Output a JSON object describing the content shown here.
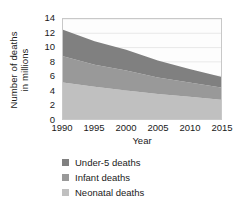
{
  "chart_data": {
    "type": "area",
    "title": "",
    "xlabel": "Year",
    "ylabel": "Number of deaths in millions",
    "ylabel_line1": "Number of deaths",
    "ylabel_line2": "in millions",
    "stacked": true,
    "grid": true,
    "legend_position": "bottom",
    "xlim": [
      1990,
      2015
    ],
    "ylim": [
      0,
      14
    ],
    "ytick_values": [
      0,
      2,
      4,
      6,
      8,
      10,
      12,
      14
    ],
    "ytick_labels": [
      "0",
      "2",
      "4",
      "6",
      "8",
      "10",
      "12",
      "14"
    ],
    "xtick_values": [
      1990,
      1995,
      2000,
      2005,
      2010,
      2015
    ],
    "xtick_labels": [
      "1990",
      "1995",
      "2000",
      "2005",
      "2010",
      "2015"
    ],
    "x": [
      1990,
      1995,
      2000,
      2005,
      2010,
      2015
    ],
    "series": [
      {
        "name": "Neonatal deaths",
        "color": "#c0c0c0",
        "values": [
          5.1,
          4.5,
          4.0,
          3.5,
          3.1,
          2.7
        ]
      },
      {
        "name": "Infant deaths",
        "color": "#999999",
        "values": [
          3.7,
          3.1,
          2.8,
          2.3,
          2.0,
          1.7
        ]
      },
      {
        "name": "Under-5 deaths",
        "color": "#808080",
        "values": [
          3.7,
          3.3,
          2.9,
          2.4,
          1.9,
          1.5
        ]
      }
    ],
    "cumulative_tops": {
      "neonatal": [
        5.1,
        4.5,
        4.0,
        3.5,
        3.1,
        2.7
      ],
      "infant": [
        8.8,
        7.6,
        6.8,
        5.8,
        5.1,
        4.4
      ],
      "under5": [
        12.5,
        10.9,
        9.7,
        8.2,
        7.0,
        5.9
      ]
    }
  },
  "axes": {
    "ylabel_line1": "Number of deaths",
    "ylabel_line2": "in millions",
    "xlabel": "Year"
  },
  "legend": {
    "items": [
      {
        "label": "Under-5 deaths",
        "color": "#808080"
      },
      {
        "label": "Infant deaths",
        "color": "#999999"
      },
      {
        "label": "Neonatal deaths",
        "color": "#c0c0c0"
      }
    ]
  },
  "colors": {
    "under5": "#808080",
    "infant": "#999999",
    "neonatal": "#c0c0c0",
    "grid": "#dcdcdc",
    "frame": "#c8c8c8",
    "text": "#1a1a1a",
    "background": "#ffffff"
  }
}
